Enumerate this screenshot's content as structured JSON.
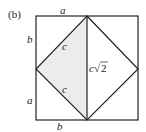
{
  "figure": {
    "panel_label": "(b)",
    "labels": {
      "top": "a",
      "left_upper": "b",
      "left_lower": "a",
      "bottom": "b",
      "hyp_upper": "c",
      "hyp_lower": "c",
      "diagonal": "c",
      "sqrt_symbol": "√",
      "sqrt_arg": "2"
    },
    "colors": {
      "stroke": "#222222",
      "shade": "#ececec",
      "background": "#ffffff"
    }
  }
}
